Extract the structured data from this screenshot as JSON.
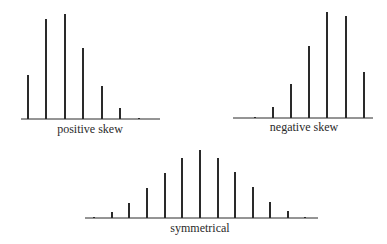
{
  "chart_data": [
    {
      "type": "bar",
      "title": "positive skew",
      "xlabel": "positive skew",
      "ylabel": "",
      "categories": [
        1,
        2,
        3,
        4,
        5,
        6,
        7
      ],
      "values": [
        44,
        100,
        105,
        71,
        33,
        11,
        1
      ],
      "grid": false,
      "layout": {
        "baseline_y": 119,
        "x_start": 21,
        "x_end": 160,
        "bar_x": [
          28,
          46,
          65,
          83,
          102,
          120,
          139
        ],
        "scale": 1,
        "label_x": 90,
        "label_y": 132
      }
    },
    {
      "type": "bar",
      "title": "negative skew",
      "xlabel": "negative skew",
      "ylabel": "",
      "categories": [
        1,
        2,
        3,
        4,
        5,
        6,
        7
      ],
      "values": [
        1,
        11,
        34,
        72,
        106,
        102,
        46
      ],
      "grid": false,
      "layout": {
        "baseline_y": 118,
        "x_start": 233,
        "x_end": 373,
        "bar_x": [
          255,
          273,
          291,
          309,
          327,
          346,
          364
        ],
        "scale": 1,
        "label_x": 304,
        "label_y": 130
      }
    },
    {
      "type": "bar",
      "title": "symmetrical",
      "xlabel": "symmetrical",
      "ylabel": "",
      "categories": [
        1,
        2,
        3,
        4,
        5,
        6,
        7,
        8,
        9,
        10,
        11,
        12,
        13
      ],
      "values": [
        1,
        6,
        15,
        30,
        45,
        60,
        68,
        60,
        46,
        31,
        16,
        7,
        1
      ],
      "grid": false,
      "layout": {
        "baseline_y": 218,
        "x_start": 85,
        "x_end": 318,
        "bar_x": [
          94,
          112,
          129,
          147,
          165,
          182,
          200,
          218,
          235,
          253,
          270,
          288,
          305
        ],
        "scale": 1,
        "label_x": 200,
        "label_y": 226
      }
    }
  ],
  "labels": {
    "positive": "positive skew",
    "negative": "negative skew",
    "symmetrical": "symmetrical"
  },
  "colors": {
    "ink": "#2a2a2a"
  }
}
